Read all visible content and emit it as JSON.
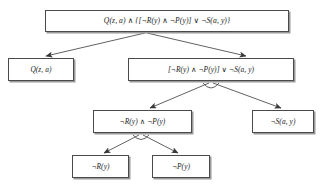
{
  "figure": {
    "type": "and-or-decomposition-tree",
    "caption": "",
    "ink_color": "#4a4a4a",
    "shadow_color": "#9a9a9a",
    "background": "#ffffff"
  },
  "nodes": {
    "root": {
      "id": "root",
      "label": "Q(z, a) ∧ {[¬R(y) ∧ ¬P(y)] ∨ ¬S(a, y)}"
    },
    "q": {
      "id": "q",
      "label": "Q(z, a)"
    },
    "or_group": {
      "id": "or_group",
      "label": "[¬R(y) ∧ ¬P(y)] ∨ ¬S(a, y)"
    },
    "and_group": {
      "id": "and_group",
      "label": "¬R(y) ∧ ¬P(y)"
    },
    "not_s": {
      "id": "not_s",
      "label": "¬S(a, y)"
    },
    "not_r": {
      "id": "not_r",
      "label": "¬R(y)"
    },
    "not_p": {
      "id": "not_p",
      "label": "¬P(y)"
    }
  },
  "edges": [
    {
      "from": "root",
      "to": "q",
      "junction": "and"
    },
    {
      "from": "root",
      "to": "or_group",
      "junction": "and"
    },
    {
      "from": "or_group",
      "to": "and_group",
      "junction": "or"
    },
    {
      "from": "or_group",
      "to": "not_s",
      "junction": "or"
    },
    {
      "from": "and_group",
      "to": "not_r",
      "junction": "and"
    },
    {
      "from": "and_group",
      "to": "not_p",
      "junction": "and"
    }
  ],
  "junction_markers": [
    {
      "under": "or_group",
      "shape": "arc",
      "meaning": "or"
    },
    {
      "under": "and_group",
      "shape": "arc",
      "meaning": "and"
    }
  ]
}
